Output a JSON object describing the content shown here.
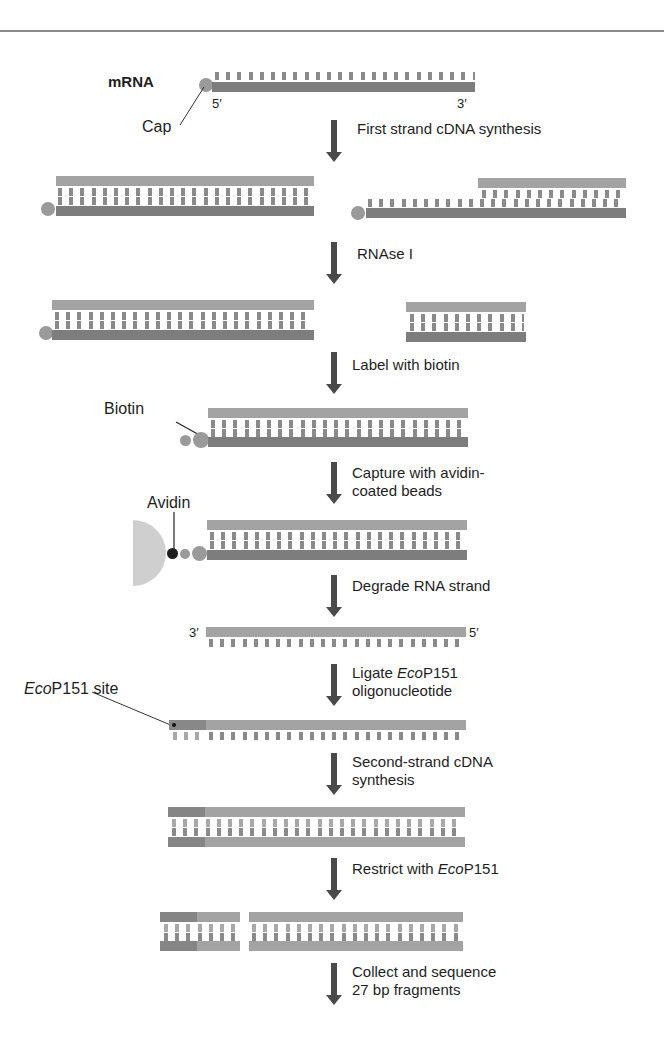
{
  "diagram": {
    "type": "workflow",
    "labels": {
      "mrna": "mRNA",
      "five_prime": "5′",
      "three_prime": "3′",
      "cap": "Cap",
      "biotin": "Biotin",
      "avidin": "Avidin",
      "ecop_site_italic": "Eco",
      "ecop_site_rest": "P151 site",
      "ss_three_prime": "3′",
      "ss_five_prime": "5′"
    },
    "steps": [
      {
        "line1": "First strand cDNA synthesis"
      },
      {
        "line1": "RNAse I"
      },
      {
        "line1": "Label with biotin"
      },
      {
        "line1": "Capture with avidin-",
        "line2": "coated beads"
      },
      {
        "line1": "Degrade RNA strand"
      },
      {
        "line1_pre": "Ligate ",
        "line1_italic": "Eco",
        "line1_post": "P151",
        "line2": "oligonucleotide"
      },
      {
        "line1": "Second-strand cDNA",
        "line2": "synthesis"
      },
      {
        "line1_pre": "Restrict with ",
        "line1_italic": "Eco",
        "line1_post": "P151"
      },
      {
        "line1": "Collect and sequence",
        "line2": "27 bp fragments"
      }
    ],
    "colors": {
      "rna_strand": "#7d7d7d",
      "cdna_strand": "#a3a3a3",
      "arrow": "#4a4a4a",
      "bead": "#cfcfcf",
      "avidin": "#222222",
      "rule": "#8a8a8a"
    }
  }
}
